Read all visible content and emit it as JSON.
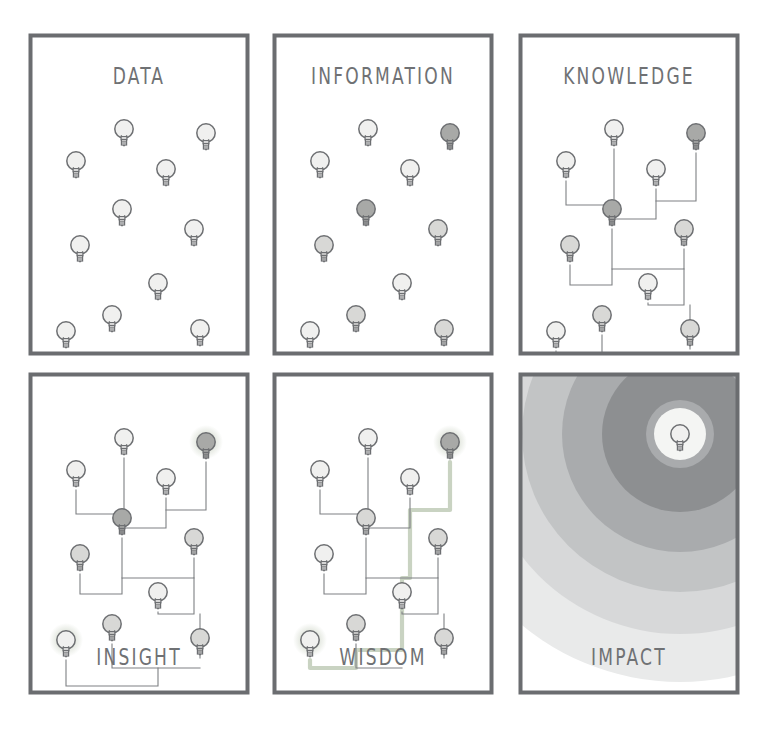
{
  "diagram": {
    "title_sequence": [
      "DATA",
      "INFORMATION",
      "KNOWLEDGE",
      "INSIGHT",
      "WISDOM",
      "IMPACT"
    ],
    "background": "#ffffff",
    "colors": {
      "panel_border": "#6b6d70",
      "panel_fill": "#ffffff",
      "title_text": "#6f7174",
      "bulb_outline": "#6d6f72",
      "bulb_fill_light": "#f0f0ef",
      "bulb_fill_mid": "#d8d8d6",
      "bulb_fill_dark": "#a8a9a7",
      "wire": "#7e8083",
      "wire_highlight": "#c9d3c2",
      "glow": "#cfd6c8",
      "ripple_1": "#8d8f91",
      "ripple_2": "#a9abad",
      "ripple_3": "#c2c4c5",
      "ripple_4": "#d7d8d9",
      "ripple_5": "#e9eaea",
      "ripple_core": "#f4f5f3"
    },
    "panel_geometry": {
      "width": 222,
      "height": 323,
      "border_width": 4,
      "columns_x": [
        28,
        272,
        518
      ],
      "rows_y": [
        33,
        372
      ]
    },
    "panels": [
      {
        "id": "data",
        "label": "DATA",
        "title_position": "top",
        "title_y": 30,
        "has_wires": false,
        "has_glow": false,
        "has_ripples": false,
        "bulbs": [
          {
            "x": 96,
            "y": 96,
            "shade": "light"
          },
          {
            "x": 178,
            "y": 100,
            "shade": "light"
          },
          {
            "x": 48,
            "y": 128,
            "shade": "light"
          },
          {
            "x": 138,
            "y": 136,
            "shade": "light"
          },
          {
            "x": 94,
            "y": 176,
            "shade": "light"
          },
          {
            "x": 166,
            "y": 196,
            "shade": "light"
          },
          {
            "x": 52,
            "y": 212,
            "shade": "light"
          },
          {
            "x": 130,
            "y": 250,
            "shade": "light"
          },
          {
            "x": 84,
            "y": 282,
            "shade": "light"
          },
          {
            "x": 38,
            "y": 298,
            "shade": "light"
          },
          {
            "x": 172,
            "y": 296,
            "shade": "light"
          }
        ],
        "wires": []
      },
      {
        "id": "information",
        "label": "INFORMATION",
        "title_position": "top",
        "title_y": 30,
        "has_wires": false,
        "has_glow": false,
        "has_ripples": false,
        "bulbs": [
          {
            "x": 96,
            "y": 96,
            "shade": "light"
          },
          {
            "x": 178,
            "y": 100,
            "shade": "dark"
          },
          {
            "x": 48,
            "y": 128,
            "shade": "light"
          },
          {
            "x": 138,
            "y": 136,
            "shade": "light"
          },
          {
            "x": 94,
            "y": 176,
            "shade": "dark"
          },
          {
            "x": 166,
            "y": 196,
            "shade": "mid"
          },
          {
            "x": 52,
            "y": 212,
            "shade": "mid"
          },
          {
            "x": 130,
            "y": 250,
            "shade": "light"
          },
          {
            "x": 84,
            "y": 282,
            "shade": "mid"
          },
          {
            "x": 38,
            "y": 298,
            "shade": "light"
          },
          {
            "x": 172,
            "y": 296,
            "shade": "mid"
          }
        ],
        "wires": []
      },
      {
        "id": "knowledge",
        "label": "KNOWLEDGE",
        "title_position": "top",
        "title_y": 30,
        "has_wires": true,
        "has_glow": false,
        "has_ripples": false,
        "bulbs": [
          {
            "x": 96,
            "y": 96,
            "shade": "light"
          },
          {
            "x": 178,
            "y": 100,
            "shade": "dark"
          },
          {
            "x": 48,
            "y": 128,
            "shade": "light"
          },
          {
            "x": 138,
            "y": 136,
            "shade": "light"
          },
          {
            "x": 94,
            "y": 176,
            "shade": "dark"
          },
          {
            "x": 166,
            "y": 196,
            "shade": "mid"
          },
          {
            "x": 52,
            "y": 212,
            "shade": "mid"
          },
          {
            "x": 130,
            "y": 250,
            "shade": "light"
          },
          {
            "x": 84,
            "y": 282,
            "shade": "mid"
          },
          {
            "x": 38,
            "y": 298,
            "shade": "light"
          },
          {
            "x": 172,
            "y": 296,
            "shade": "mid"
          }
        ],
        "wires": [
          "M48,148 L48,172 L96,172 L96,116",
          "M96,172 L96,186 L138,186 L138,156",
          "M178,120 L178,168 L138,168",
          "M94,196 L94,236",
          "M52,232 L52,252 L94,252 L94,236 L166,236 L166,216",
          "M166,236 L166,272 L130,272 L130,270",
          "M172,316 L172,272",
          "M84,302 L84,326 L172,326",
          "M38,318 L38,344 L130,344 L130,326"
        ]
      },
      {
        "id": "insight",
        "label": "INSIGHT",
        "title_position": "bottom",
        "title_y": 272,
        "has_wires": true,
        "has_glow": true,
        "has_ripples": false,
        "bulbs": [
          {
            "x": 96,
            "y": 66,
            "shade": "light"
          },
          {
            "x": 178,
            "y": 70,
            "shade": "dark",
            "glow": true
          },
          {
            "x": 48,
            "y": 98,
            "shade": "light"
          },
          {
            "x": 138,
            "y": 106,
            "shade": "light"
          },
          {
            "x": 94,
            "y": 146,
            "shade": "dark"
          },
          {
            "x": 166,
            "y": 166,
            "shade": "mid"
          },
          {
            "x": 52,
            "y": 182,
            "shade": "mid"
          },
          {
            "x": 130,
            "y": 220,
            "shade": "light"
          },
          {
            "x": 84,
            "y": 252,
            "shade": "mid"
          },
          {
            "x": 38,
            "y": 268,
            "shade": "light",
            "glow": true
          },
          {
            "x": 172,
            "y": 266,
            "shade": "mid"
          }
        ],
        "wires": [
          "M48,118 L48,142 L96,142 L96,86",
          "M96,142 L96,156 L138,156 L138,126",
          "M178,90 L178,138 L138,138",
          "M94,166 L94,206",
          "M52,202 L52,222 L94,222 L94,206 L166,206 L166,186",
          "M166,206 L166,242 L130,242 L130,240",
          "M172,286 L172,242",
          "M84,272 L84,296 L172,296",
          "M38,288 L38,314 L130,314 L130,296"
        ]
      },
      {
        "id": "wisdom",
        "label": "WISDOM",
        "title_position": "bottom",
        "title_y": 272,
        "has_wires": true,
        "has_glow": true,
        "has_ripples": false,
        "bulbs": [
          {
            "x": 96,
            "y": 66,
            "shade": "light"
          },
          {
            "x": 178,
            "y": 70,
            "shade": "dark",
            "glow": true
          },
          {
            "x": 48,
            "y": 98,
            "shade": "light"
          },
          {
            "x": 138,
            "y": 106,
            "shade": "light"
          },
          {
            "x": 94,
            "y": 146,
            "shade": "mid"
          },
          {
            "x": 166,
            "y": 166,
            "shade": "mid"
          },
          {
            "x": 52,
            "y": 182,
            "shade": "light"
          },
          {
            "x": 130,
            "y": 220,
            "shade": "light"
          },
          {
            "x": 84,
            "y": 252,
            "shade": "mid"
          },
          {
            "x": 38,
            "y": 268,
            "shade": "light",
            "glow": true
          },
          {
            "x": 172,
            "y": 266,
            "shade": "mid"
          }
        ],
        "wires": [
          "M48,118 L48,142 L96,142 L96,86",
          "M96,142 L96,156 L138,156 L138,126",
          "M94,166 L94,206",
          "M52,202 L52,222 L94,222 L94,206 L166,206 L166,186",
          "M166,206 L166,242 L130,242 L130,240",
          "M172,286 L172,242",
          "M84,272 L84,296 L130,296"
        ],
        "highlight_wires": [
          "M178,90 L178,138 L138,138 L138,206 L130,206 L130,242 L130,278 L84,278 L84,296 L38,296 L38,288"
        ]
      },
      {
        "id": "impact",
        "label": "IMPACT",
        "title_position": "bottom",
        "title_y": 272,
        "has_wires": false,
        "has_glow": false,
        "has_ripples": true,
        "ripple_center": {
          "x": 162,
          "y": 62
        },
        "ripple_radii": [
          34,
          78,
          118,
          158,
          200,
          248
        ],
        "bulbs": [
          {
            "x": 162,
            "y": 62,
            "shade": "light"
          }
        ],
        "wires": []
      }
    ]
  }
}
